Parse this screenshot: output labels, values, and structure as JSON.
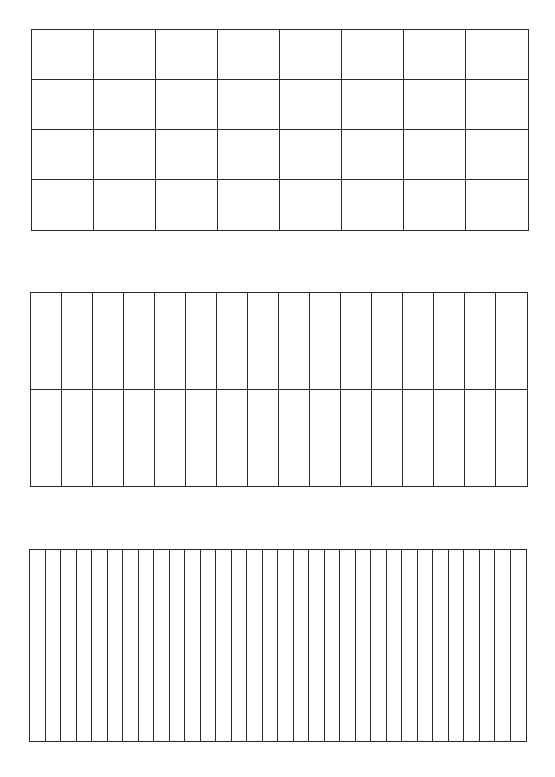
{
  "diagram": {
    "line_color": "#2a2a2a",
    "background_color": "#ffffff",
    "grids": [
      {
        "id": "grid-8x4",
        "columns": 8,
        "rows": 4,
        "left": 31,
        "top": 29,
        "width": 498,
        "height": 202
      },
      {
        "id": "grid-16x2",
        "columns": 16,
        "rows": 2,
        "left": 30,
        "top": 292,
        "width": 498,
        "height": 195
      },
      {
        "id": "grid-32x1",
        "columns": 32,
        "rows": 1,
        "left": 29,
        "top": 549,
        "width": 498,
        "height": 193
      }
    ]
  }
}
